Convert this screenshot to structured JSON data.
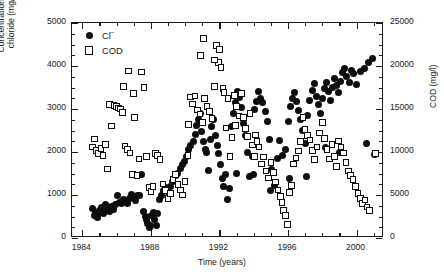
{
  "chart_data": {
    "type": "scatter",
    "title": "",
    "subtitle": "",
    "xlabel": "Time (years)",
    "ylabel": "Concentration of chloride (mg/l)",
    "ylabel_line1": "Concentration of",
    "ylabel_line2": "chloride (mg/l)",
    "y2label": "COD (mg/l)",
    "xlim": [
      1983.4,
      2001.6
    ],
    "ylim": [
      0,
      5000
    ],
    "y2lim": [
      0,
      25000
    ],
    "xticks": [
      1984,
      1988,
      1992,
      1996,
      2000
    ],
    "xticklabels": [
      "1984",
      "1988",
      "1992",
      "1996",
      "2000"
    ],
    "x_minor_step": 1,
    "yticks": [
      0,
      1000,
      2000,
      3000,
      4000,
      5000
    ],
    "yticklabels": [
      "0",
      "1000",
      "2000",
      "3000",
      "4000",
      "5000"
    ],
    "y_minor_step": 250,
    "y2ticks": [
      0,
      5000,
      10000,
      15000,
      20000,
      25000
    ],
    "y2ticklabels": [
      "0",
      "5000",
      "10000",
      "15000",
      "20000",
      "25000"
    ],
    "y2_minor_step": 1250,
    "grid": false,
    "legend_position": "upper-left-inside",
    "series": [
      {
        "name": "Cl−",
        "label_text": "Cl",
        "label_sup": "−",
        "marker": "filled-circle",
        "color": "#0d0d0d",
        "axis": "left",
        "points": [
          [
            1984.62,
            680
          ],
          [
            1984.7,
            520
          ],
          [
            1984.78,
            600
          ],
          [
            1984.86,
            470
          ],
          [
            1984.94,
            560
          ],
          [
            1985.02,
            640
          ],
          [
            1985.12,
            700
          ],
          [
            1985.22,
            560
          ],
          [
            1985.34,
            790
          ],
          [
            1985.46,
            690
          ],
          [
            1985.58,
            620
          ],
          [
            1985.7,
            740
          ],
          [
            1985.82,
            660
          ],
          [
            1985.94,
            780
          ],
          [
            1986.06,
            1000
          ],
          [
            1986.16,
            830
          ],
          [
            1986.26,
            800
          ],
          [
            1986.38,
            900
          ],
          [
            1986.5,
            860
          ],
          [
            1986.62,
            800
          ],
          [
            1986.74,
            930
          ],
          [
            1986.86,
            1010
          ],
          [
            1986.98,
            950
          ],
          [
            1987.1,
            880
          ],
          [
            1987.22,
            980
          ],
          [
            1987.34,
            1000
          ],
          [
            1987.46,
            1480
          ],
          [
            1987.58,
            620
          ],
          [
            1987.66,
            500
          ],
          [
            1987.74,
            420
          ],
          [
            1987.82,
            330
          ],
          [
            1987.9,
            250
          ],
          [
            1987.98,
            300
          ],
          [
            1988.06,
            520
          ],
          [
            1988.14,
            600
          ],
          [
            1988.22,
            420
          ],
          [
            1988.3,
            300
          ],
          [
            1988.4,
            560
          ],
          [
            1988.52,
            900
          ],
          [
            1988.64,
            1000
          ],
          [
            1988.76,
            1100
          ],
          [
            1988.88,
            1180
          ],
          [
            1989.0,
            1050
          ],
          [
            1989.14,
            1200
          ],
          [
            1989.28,
            1320
          ],
          [
            1989.42,
            1450
          ],
          [
            1989.56,
            1500
          ],
          [
            1989.7,
            1620
          ],
          [
            1989.84,
            1700
          ],
          [
            1989.98,
            1780
          ],
          [
            1990.1,
            1900
          ],
          [
            1990.22,
            2050
          ],
          [
            1990.34,
            2150
          ],
          [
            1990.46,
            2250
          ],
          [
            1990.58,
            2400
          ],
          [
            1990.68,
            2620
          ],
          [
            1990.78,
            2760
          ],
          [
            1990.88,
            2900
          ],
          [
            1990.98,
            2480
          ],
          [
            1991.06,
            2250
          ],
          [
            1991.16,
            2050
          ],
          [
            1991.26,
            1980
          ],
          [
            1991.36,
            1560
          ],
          [
            1991.46,
            2280
          ],
          [
            1991.56,
            2600
          ],
          [
            1991.66,
            2760
          ],
          [
            1991.76,
            2380
          ],
          [
            1991.86,
            2160
          ],
          [
            1991.96,
            1960
          ],
          [
            1992.06,
            1700
          ],
          [
            1992.16,
            1380
          ],
          [
            1992.26,
            1200
          ],
          [
            1992.36,
            1480
          ],
          [
            1992.46,
            900
          ],
          [
            1992.56,
            1150
          ],
          [
            1992.68,
            2600
          ],
          [
            1992.8,
            2900
          ],
          [
            1992.92,
            3150
          ],
          [
            1993.04,
            3400
          ],
          [
            1993.16,
            3260
          ],
          [
            1993.28,
            3040
          ],
          [
            1993.4,
            2660
          ],
          [
            1993.52,
            2380
          ],
          [
            1993.64,
            1980
          ],
          [
            1993.78,
            1420
          ],
          [
            1993.92,
            1900
          ],
          [
            1994.06,
            2980
          ],
          [
            1994.18,
            3180
          ],
          [
            1994.3,
            3400
          ],
          [
            1994.42,
            3250
          ],
          [
            1994.54,
            3140
          ],
          [
            1994.66,
            2950
          ],
          [
            1994.8,
            2700
          ],
          [
            1994.94,
            2300
          ],
          [
            1995.06,
            1600
          ],
          [
            1995.2,
            1220
          ],
          [
            1995.36,
            1860
          ],
          [
            1995.52,
            2260
          ],
          [
            1995.68,
            1920
          ],
          [
            1995.84,
            2060
          ],
          [
            1996.0,
            2700
          ],
          [
            1996.14,
            3050
          ],
          [
            1996.26,
            3250
          ],
          [
            1996.38,
            3380
          ],
          [
            1996.5,
            3180
          ],
          [
            1996.62,
            2960
          ],
          [
            1996.74,
            2750
          ],
          [
            1996.86,
            2500
          ],
          [
            1997.0,
            2200
          ],
          [
            1997.14,
            2850
          ],
          [
            1997.28,
            3200
          ],
          [
            1997.4,
            3420
          ],
          [
            1997.52,
            3600
          ],
          [
            1997.64,
            3300
          ],
          [
            1997.76,
            3100
          ],
          [
            1997.88,
            2900
          ],
          [
            1998.0,
            3250
          ],
          [
            1998.12,
            3480
          ],
          [
            1998.24,
            3620
          ],
          [
            1998.36,
            3400
          ],
          [
            1998.48,
            3200
          ],
          [
            1998.6,
            3500
          ],
          [
            1998.72,
            3700
          ],
          [
            1998.84,
            3550
          ],
          [
            1998.96,
            3380
          ],
          [
            1999.08,
            3650
          ],
          [
            1999.2,
            3860
          ],
          [
            1999.32,
            3950
          ],
          [
            1999.44,
            3760
          ],
          [
            1999.56,
            3620
          ],
          [
            1999.7,
            3900
          ],
          [
            1999.84,
            3820
          ],
          [
            2000.0,
            3560
          ],
          [
            2000.2,
            3880
          ],
          [
            2000.45,
            3940
          ],
          [
            2000.7,
            4080
          ],
          [
            2000.95,
            4180
          ],
          [
            1993.0,
            1500
          ],
          [
            1994.0,
            1480
          ],
          [
            1995.0,
            1100
          ],
          [
            1996.1,
            1380
          ],
          [
            1997.05,
            1420
          ],
          [
            1998.2,
            2100
          ],
          [
            1999.0,
            2000
          ],
          [
            2000.55,
            2200
          ],
          [
            2001.05,
            1950
          ]
        ]
      },
      {
        "name": "COD",
        "label_text": "COD",
        "label_sup": "",
        "marker": "open-square",
        "color": "#0d0d0d",
        "axis": "right",
        "points": [
          [
            1984.6,
            10600
          ],
          [
            1984.72,
            11500
          ],
          [
            1984.84,
            10200
          ],
          [
            1984.96,
            9800
          ],
          [
            1985.08,
            10400
          ],
          [
            1985.2,
            9600
          ],
          [
            1985.34,
            10900
          ],
          [
            1985.46,
            8000
          ],
          [
            1985.58,
            15500
          ],
          [
            1985.7,
            13000
          ],
          [
            1985.86,
            15400
          ],
          [
            1986.0,
            15300
          ],
          [
            1986.12,
            15100
          ],
          [
            1986.24,
            15000
          ],
          [
            1986.36,
            14600
          ],
          [
            1986.5,
            10700
          ],
          [
            1986.64,
            10300
          ],
          [
            1986.78,
            9900
          ],
          [
            1986.92,
            7400
          ],
          [
            1987.04,
            14000
          ],
          [
            1987.18,
            7300
          ],
          [
            1987.32,
            9200
          ],
          [
            1987.46,
            19300
          ],
          [
            1987.6,
            17500
          ],
          [
            1987.74,
            9500
          ],
          [
            1987.88,
            5900
          ],
          [
            1988.0,
            5400
          ],
          [
            1988.12,
            6000
          ],
          [
            1988.26,
            9800
          ],
          [
            1988.4,
            9600
          ],
          [
            1988.54,
            9100
          ],
          [
            1988.7,
            6300
          ],
          [
            1988.84,
            5500
          ],
          [
            1989.0,
            4600
          ],
          [
            1989.16,
            5200
          ],
          [
            1989.3,
            6800
          ],
          [
            1989.44,
            7400
          ],
          [
            1989.58,
            6200
          ],
          [
            1989.72,
            5600
          ],
          [
            1989.86,
            5000
          ],
          [
            1990.0,
            6600
          ],
          [
            1990.16,
            9600
          ],
          [
            1990.3,
            16400
          ],
          [
            1990.44,
            15600
          ],
          [
            1990.58,
            16500
          ],
          [
            1990.72,
            14900
          ],
          [
            1990.86,
            14400
          ],
          [
            1991.0,
            13400
          ],
          [
            1991.14,
            16200
          ],
          [
            1991.28,
            15300
          ],
          [
            1991.42,
            14700
          ],
          [
            1991.56,
            13900
          ],
          [
            1991.7,
            17600
          ],
          [
            1991.84,
            22400
          ],
          [
            1991.96,
            20400
          ],
          [
            1992.08,
            19800
          ],
          [
            1992.2,
            17400
          ],
          [
            1992.26,
            16900
          ],
          [
            1992.38,
            12800
          ],
          [
            1992.5,
            16200
          ],
          [
            1992.62,
            9500
          ],
          [
            1992.74,
            11700
          ],
          [
            1992.88,
            16600
          ],
          [
            1993.0,
            15300
          ],
          [
            1993.14,
            14200
          ],
          [
            1993.28,
            16800
          ],
          [
            1993.4,
            14000
          ],
          [
            1993.52,
            12700
          ],
          [
            1993.64,
            11800
          ],
          [
            1993.78,
            14500
          ],
          [
            1993.92,
            10800
          ],
          [
            1994.04,
            9500
          ],
          [
            1994.18,
            11200
          ],
          [
            1994.32,
            10600
          ],
          [
            1994.46,
            8600
          ],
          [
            1994.58,
            9400
          ],
          [
            1994.72,
            7800
          ],
          [
            1994.86,
            7000
          ],
          [
            1995.0,
            8800
          ],
          [
            1995.14,
            7600
          ],
          [
            1995.28,
            6500
          ],
          [
            1995.42,
            5600
          ],
          [
            1995.56,
            4800
          ],
          [
            1995.64,
            4100
          ],
          [
            1995.74,
            3200
          ],
          [
            1995.86,
            2600
          ],
          [
            1995.96,
            1600
          ],
          [
            1996.08,
            5300
          ],
          [
            1996.2,
            6100
          ],
          [
            1996.32,
            8600
          ],
          [
            1996.46,
            9300
          ],
          [
            1996.6,
            10100
          ],
          [
            1996.74,
            11200
          ],
          [
            1996.88,
            14000
          ],
          [
            1997.0,
            12600
          ],
          [
            1997.14,
            11900
          ],
          [
            1997.28,
            11400
          ],
          [
            1997.42,
            10200
          ],
          [
            1997.56,
            9100
          ],
          [
            1997.7,
            10600
          ],
          [
            1997.84,
            12200
          ],
          [
            1998.0,
            13400
          ],
          [
            1998.14,
            11600
          ],
          [
            1998.28,
            10300
          ],
          [
            1998.42,
            9200
          ],
          [
            1998.56,
            10900
          ],
          [
            1998.7,
            9500
          ],
          [
            1998.84,
            8300
          ],
          [
            1998.96,
            11300
          ],
          [
            1999.1,
            10600
          ],
          [
            1999.24,
            9900
          ],
          [
            1999.38,
            8800
          ],
          [
            1999.52,
            7800
          ],
          [
            1999.66,
            7300
          ],
          [
            1999.8,
            6800
          ],
          [
            1999.94,
            6000
          ],
          [
            2000.08,
            5200
          ],
          [
            2000.22,
            4600
          ],
          [
            2000.36,
            4000
          ],
          [
            2000.5,
            4400
          ],
          [
            2000.62,
            3600
          ],
          [
            2000.74,
            3200
          ],
          [
            2001.1,
            9800
          ],
          [
            1991.08,
            23200
          ],
          [
            1990.9,
            21200
          ],
          [
            1991.7,
            20700
          ],
          [
            1992.0,
            21900
          ],
          [
            1986.7,
            19400
          ],
          [
            1987.0,
            16800
          ],
          [
            1986.4,
            17600
          ],
          [
            1990.2,
            13200
          ],
          [
            1992.95,
            13100
          ],
          [
            1994.1,
            12000
          ]
        ]
      }
    ]
  }
}
